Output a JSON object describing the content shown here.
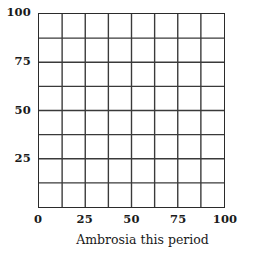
{
  "chart_data": {
    "type": "table",
    "title": "",
    "subtitle": "",
    "xlabel": "Ambrosia this period",
    "ylabel": "",
    "xlim": [
      0,
      100
    ],
    "ylim": [
      0,
      100
    ],
    "grid": true,
    "grid_divisions_x": 8,
    "grid_divisions_y": 8,
    "grid_step": 12.5,
    "legend": null,
    "series": [],
    "values": [],
    "categories": [],
    "annotations": [],
    "xticks": [
      {
        "value": 0,
        "label": "0"
      },
      {
        "value": 25,
        "label": "25"
      },
      {
        "value": 50,
        "label": "50"
      },
      {
        "value": 75,
        "label": "75"
      },
      {
        "value": 100,
        "label": "100"
      }
    ],
    "yticks": [
      {
        "value": 25,
        "label": "25"
      },
      {
        "value": 50,
        "label": "50"
      },
      {
        "value": 75,
        "label": "75"
      },
      {
        "value": 100,
        "label": "100"
      }
    ],
    "colors": {
      "background": "#ffffff",
      "grid_line": "#3a3a3a",
      "frame": "#2b2b2b",
      "text": "#1a1a1a"
    }
  }
}
